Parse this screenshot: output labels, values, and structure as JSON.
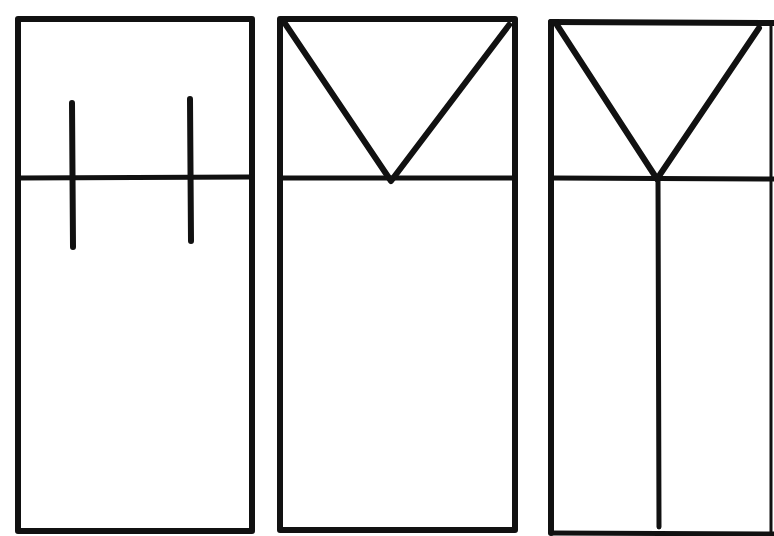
{
  "diagram": {
    "stroke_color": "#111111",
    "background": "#ffffff",
    "panels": [
      {
        "id": "panel-1",
        "pattern": "two vertical ticks crossing the horizontal divider"
      },
      {
        "id": "panel-2",
        "pattern": "V shape from top corners meeting at divider"
      },
      {
        "id": "panel-3",
        "pattern": "Y shape: V from top corners continuing as vertical line to bottom"
      }
    ]
  }
}
